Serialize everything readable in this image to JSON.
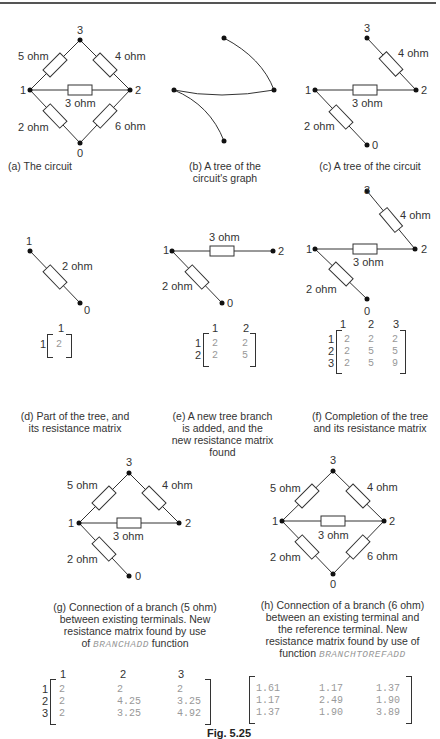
{
  "figure_number": "Fig. 5.25",
  "panels": {
    "a": {
      "caption": "(a) The circuit",
      "nodes": [
        "0",
        "1",
        "2",
        "3"
      ],
      "branches": [
        {
          "from": "1",
          "to": "3",
          "label": "5 ohm"
        },
        {
          "from": "3",
          "to": "2",
          "label": "4 ohm"
        },
        {
          "from": "1",
          "to": "2",
          "label": "3 ohm"
        },
        {
          "from": "1",
          "to": "0",
          "label": "2 ohm"
        },
        {
          "from": "2",
          "to": "0",
          "label": "6 ohm"
        }
      ]
    },
    "b": {
      "caption_line1": "(b) A tree of the",
      "caption_line2": "circuit's graph"
    },
    "c": {
      "caption": "(c) A tree of the circuit",
      "labels": {
        "r4": "4 ohm",
        "r3": "3 ohm",
        "r2": "2 ohm",
        "n0": "0",
        "n1": "1",
        "n2": "2",
        "n3": "3"
      }
    },
    "d": {
      "caption_line1": "(d) Part of the tree, and",
      "caption_line2": "its resistance matrix",
      "labels": {
        "r2": "2 ohm",
        "n1": "1",
        "n0": "0"
      },
      "matrix": {
        "cols": [
          "1"
        ],
        "rows": [
          "1"
        ],
        "values": [
          [
            "2"
          ]
        ]
      }
    },
    "e": {
      "caption_line1": "(e) A new tree branch",
      "caption_line2": "is added, and the",
      "caption_line3": "new resistance matrix",
      "caption_line4": "found",
      "labels": {
        "r3": "3 ohm",
        "r2": "2 ohm",
        "n0": "0",
        "n1": "1",
        "n2": "2"
      },
      "matrix": {
        "cols": [
          "1",
          "2"
        ],
        "rows": [
          "1",
          "2"
        ],
        "values": [
          [
            "2",
            "2"
          ],
          [
            "2",
            "5"
          ]
        ]
      }
    },
    "f": {
      "caption_line1": "(f) Completion of the tree",
      "caption_line2": "and its resistance matrix",
      "labels": {
        "r4": "4 ohm",
        "r3": "3 ohm",
        "r2": "2 ohm",
        "n0": "0",
        "n1": "1",
        "n2": "2",
        "n3": "3"
      },
      "matrix": {
        "cols": [
          "1",
          "2",
          "3"
        ],
        "rows": [
          "1",
          "2",
          "3"
        ],
        "values": [
          [
            "2",
            "2",
            "2"
          ],
          [
            "2",
            "5",
            "5"
          ],
          [
            "2",
            "5",
            "9"
          ]
        ]
      }
    },
    "g": {
      "caption_line1": "(g) Connection of a branch (5 ohm)",
      "caption_line2": "between existing terminals. New",
      "caption_line3": "resistance matrix found by use",
      "caption_line4_pre": "of",
      "caption_func": "BRANCHADD",
      "caption_line4_post": "function",
      "labels": {
        "r5": "5 ohm",
        "r4": "4 ohm",
        "r3": "3 ohm",
        "r2": "2 ohm",
        "n0": "0",
        "n1": "1",
        "n2": "2",
        "n3": "3"
      },
      "matrix": {
        "cols": [
          "1",
          "2",
          "3"
        ],
        "rows": [
          "1",
          "2",
          "3"
        ],
        "values": [
          [
            "2",
            "2",
            "2"
          ],
          [
            "2",
            "4.25",
            "3.25"
          ],
          [
            "2",
            "3.25",
            "4.92"
          ]
        ]
      }
    },
    "h": {
      "caption_line1": "(h) Connection of a branch (6 ohm)",
      "caption_line2": "between an existing terminal and",
      "caption_line3": "the reference terminal. New",
      "caption_line4": "resistance matrix found by use of",
      "caption_line5_pre": "function",
      "caption_func": "BRANCHTOREFADD",
      "labels": {
        "r5": "5 ohm",
        "r4": "4 ohm",
        "r3": "3 ohm",
        "r2": "2 ohm",
        "r6": "6 ohm",
        "n0": "0",
        "n1": "1",
        "n2": "2",
        "n3": "3"
      },
      "matrix": {
        "values": [
          [
            "1.61",
            "1.17",
            "1.37"
          ],
          [
            "1.17",
            "2.49",
            "1.90"
          ],
          [
            "1.37",
            "1.90",
            "3.89"
          ]
        ]
      }
    }
  }
}
